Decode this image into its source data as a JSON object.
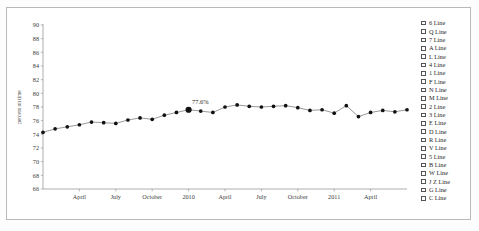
{
  "chart_data": {
    "type": "line",
    "title": "",
    "xlabel": "",
    "ylabel": "percent on time",
    "ylim": [
      66,
      90
    ],
    "ytick_step": 2,
    "yticks": [
      90,
      88,
      86,
      84,
      82,
      80,
      78,
      76,
      74,
      72,
      70,
      68,
      66
    ],
    "grid": false,
    "legend_position": "right",
    "x": [
      "January 2009",
      "February 2009",
      "March 2009",
      "April 2009",
      "May 2009",
      "June 2009",
      "July 2009",
      "August 2009",
      "September 2009",
      "October 2009",
      "November 2009",
      "December 2009",
      "January 2010",
      "February 2010",
      "March 2010",
      "April 2010",
      "May 2010",
      "June 2010",
      "July 2010",
      "August 2010",
      "September 2010",
      "October 2010",
      "November 2010",
      "December 2010",
      "January 2011",
      "February 2011",
      "March 2011",
      "April 2011",
      "May 2011",
      "June 2011",
      "July 2011"
    ],
    "xtick_labels": [
      "April",
      "July",
      "October",
      "2010",
      "April",
      "July",
      "October",
      "2011",
      "April"
    ],
    "xtick_indices": [
      3,
      6,
      9,
      12,
      15,
      18,
      21,
      24,
      27
    ],
    "series": [
      {
        "name": "percent on time",
        "values": [
          74.3,
          74.8,
          75.1,
          75.4,
          75.8,
          75.7,
          75.6,
          76.1,
          76.4,
          76.2,
          76.8,
          77.2,
          77.6,
          77.4,
          77.2,
          78.0,
          78.3,
          78.1,
          78.0,
          78.1,
          78.2,
          77.9,
          77.5,
          77.6,
          77.1,
          78.2,
          76.6,
          77.2,
          77.5,
          77.3,
          77.6
        ]
      }
    ],
    "annotations": [
      {
        "label": "77.6%",
        "x_index": 12,
        "value": 77.6,
        "highlighted": true
      }
    ]
  },
  "legend": {
    "items": [
      {
        "label": "6 Line",
        "checked": false
      },
      {
        "label": "Q Line",
        "checked": false
      },
      {
        "label": "7 Line",
        "checked": false
      },
      {
        "label": "A Line",
        "checked": false
      },
      {
        "label": "L Line",
        "checked": false
      },
      {
        "label": "4 Line",
        "checked": false
      },
      {
        "label": "1 Line",
        "checked": false
      },
      {
        "label": "F Line",
        "checked": false
      },
      {
        "label": "N Line",
        "checked": false
      },
      {
        "label": "M Line",
        "checked": false
      },
      {
        "label": "2 Line",
        "checked": false
      },
      {
        "label": "3 Line",
        "checked": false
      },
      {
        "label": "E Line",
        "checked": false
      },
      {
        "label": "D Line",
        "checked": false
      },
      {
        "label": "R Line",
        "checked": false
      },
      {
        "label": "V Line",
        "checked": false
      },
      {
        "label": "5 Line",
        "checked": false
      },
      {
        "label": "B Line",
        "checked": false
      },
      {
        "label": "W Line",
        "checked": false
      },
      {
        "label": "J Z Line",
        "checked": false
      },
      {
        "label": "G Line",
        "checked": false
      },
      {
        "label": "C Line",
        "checked": false
      }
    ]
  },
  "colors": {
    "line": "#8d8d8d",
    "marker": "#111111",
    "axis": "#9a9a9a",
    "text": "#1f1f1f",
    "frame": "#b9b9b9",
    "background": "#ffffff"
  }
}
